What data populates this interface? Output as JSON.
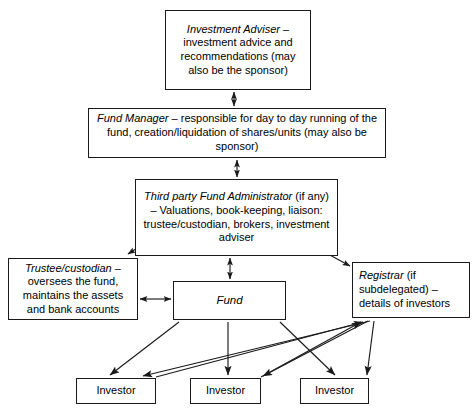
{
  "diagram": {
    "type": "flowchart",
    "background_color": "#ffffff",
    "line_color": "#1a1a1a",
    "nodes": {
      "investment_adviser": {
        "label": "Investment Adviser – investment advice and recommendations (may also be the sponsor)",
        "emphasis": "Investment Adviser"
      },
      "fund_manager": {
        "label": "Fund Manager – responsible for day to day running of the fund, creation/liquidation of shares/units (may also be sponsor)",
        "emphasis": "Fund Manager"
      },
      "fund_administrator": {
        "label": "Third party Fund Administrator (if any) – Valuations, book-keeping, liaison: trustee/custodian, brokers, investment adviser",
        "emphasis": "Third party Fund Administrator"
      },
      "trustee_custodian": {
        "label": "Trustee/custodian – oversees the fund, maintains the assets and bank accounts",
        "emphasis": "Trustee/custodian"
      },
      "fund": {
        "label": "Fund",
        "emphasis": "Fund"
      },
      "registrar": {
        "label": "Registrar (if subdelegated) – details of investors",
        "emphasis": "Registrar"
      },
      "investor_1": {
        "label": "Investor"
      },
      "investor_2": {
        "label": "Investor"
      },
      "investor_3": {
        "label": "Investor"
      }
    },
    "edges": [
      {
        "from": "investment_adviser",
        "to": "fund_manager",
        "arrow": "double"
      },
      {
        "from": "fund_manager",
        "to": "fund_administrator",
        "arrow": "double"
      },
      {
        "from": "fund_administrator",
        "to": "trustee_custodian",
        "arrow": "double"
      },
      {
        "from": "fund_administrator",
        "to": "fund",
        "arrow": "double"
      },
      {
        "from": "fund_administrator",
        "to": "registrar",
        "arrow": "double"
      },
      {
        "from": "trustee_custodian",
        "to": "fund",
        "arrow": "double"
      },
      {
        "from": "fund",
        "to": "investor_1",
        "arrow": "single"
      },
      {
        "from": "fund",
        "to": "investor_2",
        "arrow": "single"
      },
      {
        "from": "fund",
        "to": "investor_3",
        "arrow": "single"
      },
      {
        "from": "registrar",
        "to": "investor_1",
        "arrow": "single"
      },
      {
        "from": "registrar",
        "to": "investor_2",
        "arrow": "single"
      },
      {
        "from": "registrar",
        "to": "investor_3",
        "arrow": "single"
      },
      {
        "from": "investor_1",
        "to": "registrar",
        "arrow": "single"
      },
      {
        "from": "investor_2",
        "to": "registrar",
        "arrow": "single"
      }
    ]
  }
}
